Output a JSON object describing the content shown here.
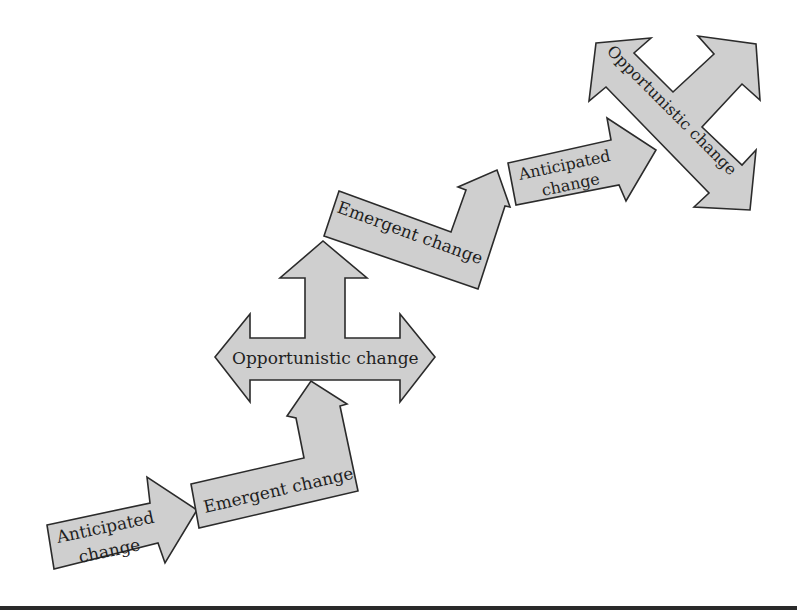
{
  "diagram": {
    "style": {
      "fill": "#cfcfcf",
      "stroke": "#2b2b2b",
      "text": "#1f1f1f"
    },
    "steps": [
      {
        "id": "anticipated-1",
        "type": "Anticipated change",
        "lines": [
          "Anticipated",
          "change"
        ]
      },
      {
        "id": "emergent-1",
        "type": "Emergent change",
        "lines": [
          "Emergent change"
        ]
      },
      {
        "id": "opportunistic-1",
        "type": "Opportunistic change",
        "lines": [
          "Opportunistic change"
        ]
      },
      {
        "id": "emergent-2",
        "type": "Emergent change",
        "lines": [
          "Emergent change"
        ]
      },
      {
        "id": "anticipated-2",
        "type": "Anticipated change",
        "lines": [
          "Anticipated",
          "change"
        ]
      },
      {
        "id": "opportunistic-2",
        "type": "Opportunistic change",
        "lines": [
          "Opportunistic change"
        ]
      }
    ]
  }
}
